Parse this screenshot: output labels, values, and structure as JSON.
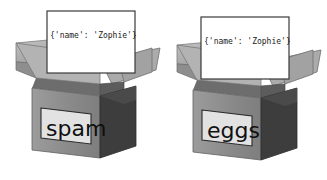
{
  "figure": {
    "background_color": "#ffffff"
  },
  "palette": {
    "card_fill": "#ffffff",
    "card_border": "#3a3a3a",
    "flap_outer_light": "#b8b8b8",
    "flap_outer_mid": "#9a9a9a",
    "flap_inner_dark": "#6b6b6b",
    "front_face": "#8c8c8c",
    "side_face": "#3d3d3d",
    "label_plate": "#e2e2e2",
    "label_plate_border": "#2a2a2a",
    "text_dark": "#101010"
  },
  "boxes": [
    {
      "id": "left",
      "card_text": "{'name': 'Zophie'}",
      "face_label": "spam"
    },
    {
      "id": "right",
      "card_text": "{'name': 'Zophie'}",
      "face_label": "eggs"
    }
  ]
}
